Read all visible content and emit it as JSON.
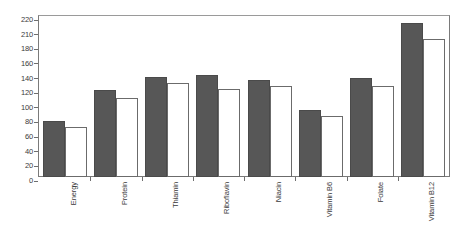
{
  "chart_data": {
    "type": "bar",
    "title": "",
    "subtitle": "",
    "xlabel": "",
    "ylabel": "",
    "ylim": [
      0,
      220
    ],
    "grid": false,
    "legend": "none",
    "ytick_labels": [
      "220",
      "210",
      "180",
      "160",
      "140",
      "120",
      "100",
      "80",
      "60",
      "40",
      "20",
      "0"
    ],
    "categories": [
      "Energy",
      "Protein",
      "Thiamin",
      "Riboflavin",
      "Niacin",
      "Vitamin B6",
      "Folate",
      "Vitamin B12"
    ],
    "series": [
      {
        "name": "series-1-dark",
        "color": "#575757",
        "values": [
          76,
          119,
          137,
          139,
          133,
          92,
          135,
          210
        ]
      },
      {
        "name": "series-2-white",
        "color": "#ffffff",
        "values": [
          69,
          108,
          129,
          120,
          124,
          83,
          124,
          189
        ]
      }
    ]
  }
}
